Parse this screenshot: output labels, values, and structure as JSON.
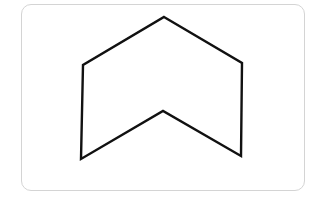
{
  "diagram": {
    "type": "polygon",
    "stroke_color": "#111111",
    "fill_color": "#ffffff",
    "frame_border_color": "#d4d4d4",
    "vertices": [
      {
        "name": "top",
        "x": 164,
        "y": 17
      },
      {
        "name": "upper-right",
        "x": 242,
        "y": 63
      },
      {
        "name": "lower-right",
        "x": 241,
        "y": 156
      },
      {
        "name": "inner-notch",
        "x": 163,
        "y": 111
      },
      {
        "name": "lower-left",
        "x": 81,
        "y": 159
      },
      {
        "name": "upper-left",
        "x": 83,
        "y": 65
      }
    ]
  }
}
